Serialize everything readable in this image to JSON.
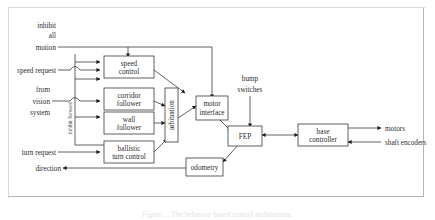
{
  "figure": {
    "type": "block-diagram",
    "caption": "Figure ... The behavior-based control architecture.",
    "nodes": [
      {
        "id": "speed_control",
        "label_line1": "speed",
        "label_line2": "control"
      },
      {
        "id": "corridor_follower",
        "label_line1": "corridor",
        "label_line2": "follower"
      },
      {
        "id": "wall_follower",
        "label_line1": "wall",
        "label_line2": "follower"
      },
      {
        "id": "ballistic_turn",
        "label_line1": "ballistic",
        "label_line2": "turn control"
      },
      {
        "id": "arbitration",
        "label_line1": "arbitration",
        "label_line2": ""
      },
      {
        "id": "motor_interface",
        "label_line1": "motor",
        "label_line2": "interface"
      },
      {
        "id": "fep",
        "label_line1": "FEP",
        "label_line2": ""
      },
      {
        "id": "base_controller",
        "label_line1": "base",
        "label_line2": "controller"
      },
      {
        "id": "odometry",
        "label_line1": "odometry",
        "label_line2": ""
      }
    ],
    "io_labels": {
      "inhibit_all_motion_1": "inhibit",
      "inhibit_all_motion_2": "all",
      "inhibit_all_motion_3": "motion",
      "speed_request": "speed request",
      "from_vision_1": "from",
      "from_vision_2": "vision",
      "from_vision_3": "system",
      "turn_request": "turn request",
      "direction": "direction",
      "inhibit_forward": "inhibit forward",
      "bump_switches_1": "bump",
      "bump_switches_2": "switches",
      "motors": "motors",
      "shaft_encoders": "shaft encoders"
    },
    "colors": {
      "ink": "#2b2b2b",
      "wire": "#3a3a3a",
      "page": "#ffffff",
      "frame": "#b6b6b6"
    }
  }
}
